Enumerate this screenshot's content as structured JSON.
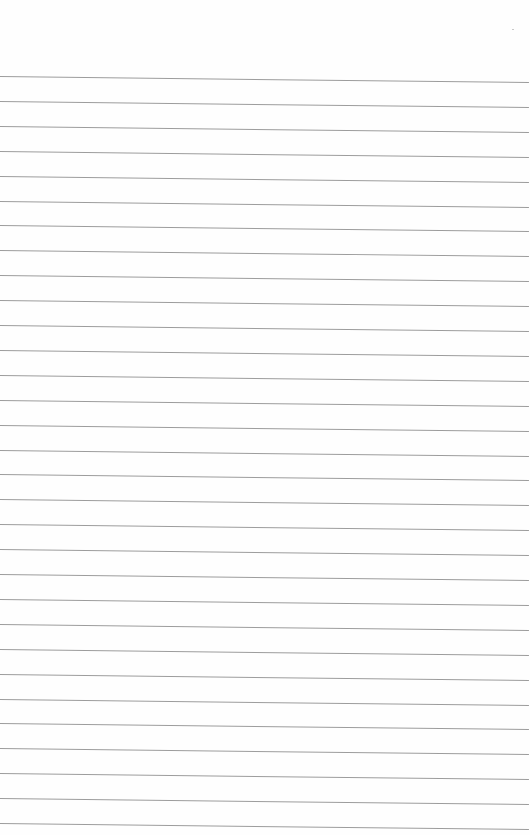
{
  "page": {
    "type": "blank lined paper",
    "background": "#fefefe",
    "line_color": "#9c9c9c",
    "line_count": 31,
    "first_line_y_left": 76,
    "first_line_y_right": 82,
    "line_spacing": 24.9,
    "line_width": 529
  }
}
